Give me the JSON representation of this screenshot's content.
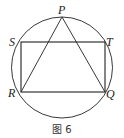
{
  "figure": {
    "caption": "图 6",
    "points": {
      "P": "P",
      "S": "S",
      "T": "T",
      "R": "R",
      "Q": "Q"
    },
    "shapes": {
      "circle": "circumcircle",
      "rectangle": [
        "S",
        "T",
        "Q",
        "R"
      ],
      "triangle": [
        "P",
        "R",
        "Q"
      ]
    },
    "colors": {
      "stroke": "#222222",
      "background": "#ffffff"
    }
  }
}
